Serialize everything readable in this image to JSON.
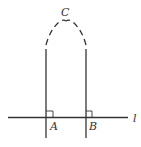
{
  "diagram": {
    "points": {
      "A": "A",
      "B": "B",
      "C": "C"
    },
    "line_label": "l",
    "stroke_color": "#333333"
  }
}
